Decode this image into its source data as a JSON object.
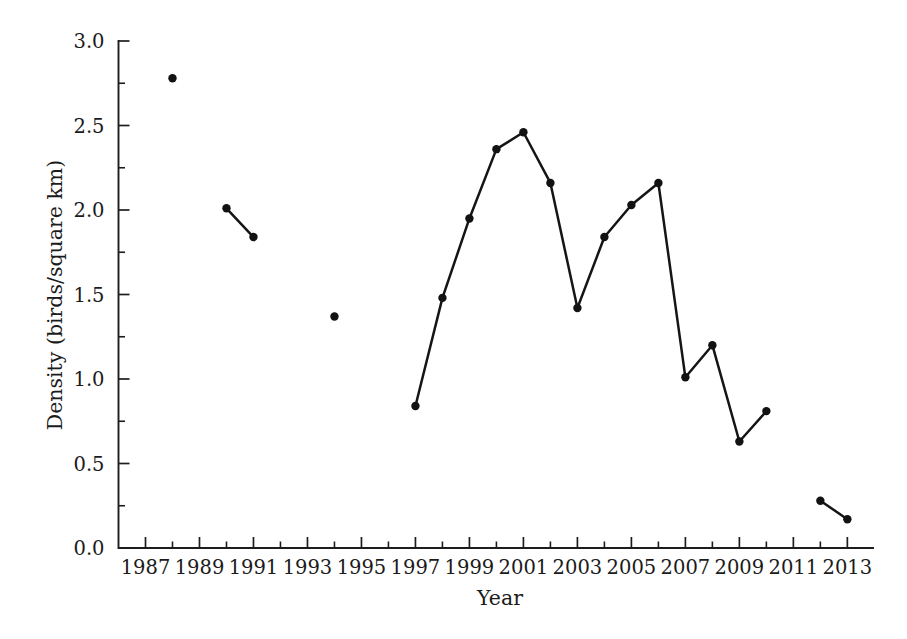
{
  "chart_data": {
    "type": "line",
    "title": "",
    "subtitle": "",
    "xlabel": "Year",
    "ylabel": "Density (birds/square km)",
    "xlim": [
      1986.0,
      2013.95
    ],
    "ylim": [
      0.0,
      3.0
    ],
    "grid": false,
    "legend": null,
    "annotations": [],
    "x_tick_labels": [
      "1987",
      "1989",
      "1991",
      "1993",
      "1995",
      "1997",
      "1999",
      "2001",
      "2003",
      "2005",
      "2007",
      "2009",
      "2011",
      "2013"
    ],
    "x_tick_values": [
      1987,
      1989,
      1991,
      1993,
      1995,
      1997,
      1999,
      2001,
      2003,
      2005,
      2007,
      2009,
      2011,
      2013
    ],
    "x_minor_tick_values": [
      1988,
      1990,
      1992,
      1994,
      1996,
      1998,
      2000,
      2002,
      2004,
      2006,
      2008,
      2010,
      2012
    ],
    "y_tick_labels": [
      "0.0",
      "0.5",
      "1.0",
      "1.5",
      "2.0",
      "2.5",
      "3.0"
    ],
    "y_tick_values": [
      0.0,
      0.5,
      1.0,
      1.5,
      2.0,
      2.5,
      3.0
    ],
    "y_minor_tick_values": [
      0.25,
      0.75,
      1.25,
      1.75,
      2.25,
      2.75
    ],
    "marker": "circle",
    "marker_color": "#121212",
    "line_color": "#151515",
    "series": [
      {
        "name": "Density",
        "segments": [
          {
            "points": [
              {
                "x": 1988,
                "y": 2.78
              }
            ]
          },
          {
            "points": [
              {
                "x": 1990,
                "y": 2.01
              },
              {
                "x": 1991,
                "y": 1.84
              }
            ]
          },
          {
            "points": [
              {
                "x": 1994,
                "y": 1.37
              }
            ]
          },
          {
            "points": [
              {
                "x": 1997,
                "y": 0.84
              },
              {
                "x": 1998,
                "y": 1.48
              },
              {
                "x": 1999,
                "y": 1.95
              },
              {
                "x": 2000,
                "y": 2.36
              },
              {
                "x": 2001,
                "y": 2.46
              },
              {
                "x": 2002,
                "y": 2.16
              },
              {
                "x": 2003,
                "y": 1.42
              },
              {
                "x": 2004,
                "y": 1.84
              },
              {
                "x": 2005,
                "y": 2.03
              },
              {
                "x": 2006,
                "y": 2.16
              },
              {
                "x": 2007,
                "y": 1.01
              },
              {
                "x": 2008,
                "y": 1.2
              },
              {
                "x": 2009,
                "y": 0.63
              },
              {
                "x": 2010,
                "y": 0.81
              }
            ]
          },
          {
            "points": [
              {
                "x": 2012,
                "y": 0.28
              },
              {
                "x": 2013,
                "y": 0.17
              }
            ]
          }
        ]
      }
    ]
  }
}
